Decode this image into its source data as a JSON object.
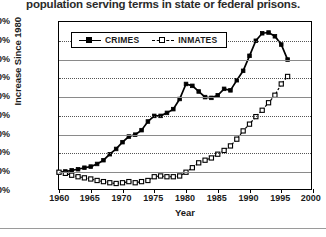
{
  "caption": "population serving terms in state or federal prisons.",
  "axes": {
    "ylabel": "Increase Since 1980",
    "xlabel": "Year",
    "yticks": [
      "400%",
      "350%",
      "300%",
      "250%",
      "200%",
      "150%",
      "100%",
      "50%",
      "0%",
      "-50%"
    ],
    "xticks": [
      "1960",
      "1965",
      "1970",
      "1975",
      "1980",
      "1985",
      "1990",
      "1995",
      "2000"
    ]
  },
  "legend": {
    "items": [
      {
        "label": "CRIMES",
        "marker": "filled-square",
        "line": "solid"
      },
      {
        "label": "INMATES",
        "marker": "open-square",
        "line": "dashed"
      }
    ]
  },
  "colors": {
    "line": "#000000",
    "grid": "#555555",
    "frame": "#000000",
    "background": "#ffffff"
  },
  "chart_data": {
    "type": "line",
    "title": "",
    "subtitle": "",
    "xlabel": "Year",
    "ylabel": "Increase Since 1980",
    "xlim": [
      1960,
      2000
    ],
    "ylim": [
      -50,
      400
    ],
    "ytick_step": 50,
    "xtick_step": 5,
    "grid": true,
    "legend_position": "top-left-inside",
    "units": "percent change since 1980",
    "series": [
      {
        "name": "CRIMES",
        "marker": "filled-square",
        "line": "solid",
        "x": [
          1960,
          1961,
          1962,
          1963,
          1964,
          1965,
          1966,
          1967,
          1968,
          1969,
          1970,
          1971,
          1972,
          1973,
          1974,
          1975,
          1976,
          1977,
          1978,
          1979,
          1980,
          1981,
          1982,
          1983,
          1984,
          1985,
          1986,
          1987,
          1988,
          1989,
          1990,
          1991,
          1992,
          1993,
          1994,
          1995,
          1996
        ],
        "y": [
          0,
          2,
          5,
          8,
          12,
          15,
          22,
          32,
          48,
          62,
          80,
          95,
          100,
          112,
          135,
          150,
          150,
          158,
          168,
          195,
          235,
          230,
          215,
          200,
          198,
          205,
          222,
          218,
          245,
          270,
          310,
          350,
          370,
          372,
          362,
          340,
          300
        ]
      },
      {
        "name": "INMATES",
        "marker": "open-square",
        "line": "dashed",
        "x": [
          1960,
          1961,
          1962,
          1963,
          1964,
          1965,
          1966,
          1967,
          1968,
          1969,
          1970,
          1971,
          1972,
          1973,
          1974,
          1975,
          1976,
          1977,
          1978,
          1979,
          1980,
          1981,
          1982,
          1983,
          1984,
          1985,
          1986,
          1987,
          1988,
          1989,
          1990,
          1991,
          1992,
          1993,
          1994,
          1995,
          1996
        ],
        "y": [
          0,
          -3,
          -8,
          -12,
          -15,
          -18,
          -22,
          -25,
          -28,
          -30,
          -28,
          -25,
          -28,
          -25,
          -22,
          -12,
          -10,
          -12,
          -12,
          -10,
          0,
          12,
          25,
          32,
          38,
          48,
          58,
          70,
          88,
          110,
          128,
          148,
          165,
          185,
          205,
          235,
          255
        ]
      }
    ],
    "annotations": [
      {
        "text": "CRIMES peak",
        "x": 1992,
        "y": 372
      },
      {
        "text": "INMATES endpoint",
        "x": 1996,
        "y": 255
      }
    ]
  }
}
